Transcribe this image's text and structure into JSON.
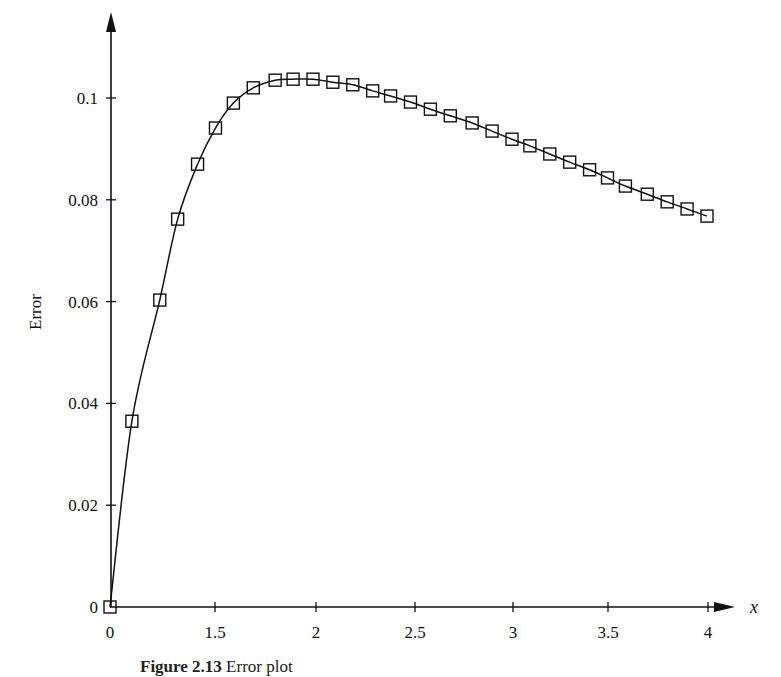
{
  "chart_data": {
    "type": "line",
    "title": "",
    "xlabel": "x",
    "ylabel": "Error",
    "x_tick_labels": [
      "0",
      "1.5",
      "2",
      "2.5",
      "3",
      "3.5",
      "4"
    ],
    "y_tick_labels": [
      "0",
      "0.02",
      "0.04",
      "0.06",
      "0.08",
      "0.1"
    ],
    "y_ticks": [
      0,
      0.02,
      0.04,
      0.06,
      0.08,
      0.1
    ],
    "ylim": [
      0,
      0.115
    ],
    "xlim": [
      1.0,
      4.0
    ],
    "grid": false,
    "legend": null,
    "marker": "open-square",
    "series": [
      {
        "name": "Error",
        "x": [
          1.0,
          1.11,
          1.25,
          1.34,
          1.44,
          1.53,
          1.62,
          1.72,
          1.83,
          1.92,
          2.02,
          2.12,
          2.22,
          2.32,
          2.41,
          2.51,
          2.61,
          2.71,
          2.82,
          2.92,
          3.02,
          3.11,
          3.21,
          3.31,
          3.41,
          3.5,
          3.59,
          3.7,
          3.8,
          3.9,
          4.0
        ],
        "values": [
          0.0,
          0.0365,
          0.0603,
          0.0762,
          0.087,
          0.0941,
          0.099,
          0.102,
          0.1035,
          0.1037,
          0.1037,
          0.1031,
          0.1026,
          0.1014,
          0.1004,
          0.0992,
          0.0978,
          0.0965,
          0.0951,
          0.0935,
          0.0919,
          0.0906,
          0.089,
          0.0874,
          0.0859,
          0.0843,
          0.0827,
          0.0811,
          0.0796,
          0.0782,
          0.0768
        ]
      }
    ]
  },
  "caption": {
    "label": "Figure 2.13",
    "text": "Error plot"
  }
}
